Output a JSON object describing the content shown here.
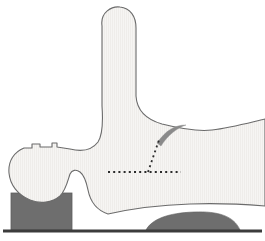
{
  "figure": {
    "width": 265,
    "height": 241,
    "background_color": "#ffffff"
  },
  "colors": {
    "background": "#ffffff",
    "silhouette_fill": "#f5f4f2",
    "silhouette_stripe": "#eceae7",
    "silhouette_outline": "#6b6b6b",
    "support_block": "#6e6e6e",
    "support_block_outline": "#5e5e5e",
    "baseline": "#3c3c3c",
    "dotted_line": "#2b2b2b",
    "arc_annotation": "#8a8a8a"
  },
  "shapes": {
    "silhouette": {
      "name": "main-silhouette",
      "description": "Light gray body outline with superior finger-like process, left rounded blob and broad posterior body",
      "path": "M 102 26 C 100 12, 112 6, 120 7 C 130 8, 136 16, 136 28 L 136 96 C 137 112, 148 120, 162 124 C 178 128, 196 132, 212 130 C 230 128, 248 123, 265 119 L 265 206 C 240 204, 215 203, 190 204 C 160 205, 130 209, 108 214 C 96 210, 90 200, 88 190 C 86 180, 84 175, 80 172 C 76 169, 72 170, 70 174 C 68 180, 66 190, 60 196 C 52 203, 40 204, 30 200 C 18 195, 10 185, 9 173 C 8 161, 14 152, 24 148 L 32 148 L 32 144 L 40 144 L 40 147 L 52 147 L 52 143 L 57 143 L 57 147 L 70 149 C 82 152, 92 150, 98 142 C 103 134, 103 120, 102 106 Z"
    },
    "support_block_left": {
      "name": "support-block-left",
      "description": "Dark gray rectangular support under left blob",
      "x": 11,
      "y": 193,
      "width": 61,
      "height": 37
    },
    "support_block_right": {
      "name": "support-block-right",
      "description": "Dark gray flattened lens-shaped support at lower right",
      "path": "M 146 230 C 152 219, 168 213, 194 212 C 218 211, 234 216, 240 230 Z"
    },
    "baseline": {
      "name": "baseline",
      "description": "Dark horizontal ground reference line",
      "x1": 3,
      "y1": 231,
      "x2": 262,
      "y2": 231,
      "stroke_width": 3
    }
  },
  "annotations": {
    "angle_vertex": {
      "x": 148,
      "y": 172
    },
    "horizontal_reference": {
      "name": "horizontal-reference-line",
      "style": "dotted",
      "x1": 108,
      "y1": 172,
      "x2": 181,
      "y2": 172
    },
    "oblique_reference": {
      "name": "oblique-reference-line",
      "style": "dotted",
      "x1": 148,
      "y1": 172,
      "x2": 159,
      "y2": 140
    },
    "arc": {
      "name": "angle-arc",
      "description": "Tapered gray crescent arc sweeping from oblique line to posterior contour",
      "path": "M 157 143 C 166 130, 175 125, 186 125 C 177 128, 168 135, 161 146 Z"
    }
  }
}
